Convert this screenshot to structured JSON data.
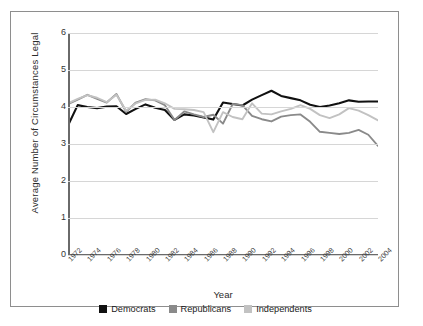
{
  "chart_data": {
    "type": "line",
    "title": "",
    "xlabel": "Year",
    "ylabel": "Average Number of Circumstances Legal",
    "xlim": [
      1972,
      2004
    ],
    "ylim": [
      0,
      6
    ],
    "yticks": [
      0,
      1,
      2,
      3,
      4,
      5,
      6
    ],
    "xticks": [
      1972,
      1974,
      1976,
      1978,
      1980,
      1982,
      1984,
      1986,
      1988,
      1990,
      1992,
      1994,
      1996,
      1998,
      2000,
      2002,
      2004
    ],
    "grid": true,
    "legend_position": "bottom",
    "x": [
      1972,
      1973,
      1974,
      1975,
      1976,
      1977,
      1978,
      1979,
      1980,
      1981,
      1982,
      1983,
      1984,
      1985,
      1986,
      1987,
      1988,
      1989,
      1990,
      1991,
      1992,
      1993,
      1994,
      1995,
      1996,
      1997,
      1998,
      1999,
      2000,
      2001,
      2002,
      2003,
      2004
    ],
    "series": [
      {
        "name": "Democrats",
        "color": "#111111",
        "values": [
          3.5,
          4.05,
          4.0,
          3.97,
          4.01,
          4.02,
          3.81,
          3.95,
          4.07,
          3.98,
          3.92,
          3.65,
          3.8,
          3.77,
          3.72,
          3.66,
          4.12,
          4.08,
          4.04,
          4.2,
          4.32,
          4.44,
          4.3,
          4.24,
          4.18,
          4.06,
          4.0,
          4.04,
          4.1,
          4.18,
          4.14,
          4.15,
          4.15
        ]
      },
      {
        "name": "Republicans",
        "color": "#8a8a8a",
        "values": [
          4.08,
          4.2,
          4.33,
          4.22,
          4.12,
          4.35,
          3.87,
          4.12,
          4.21,
          4.18,
          4.05,
          3.65,
          3.88,
          3.8,
          3.73,
          3.79,
          3.55,
          4.08,
          4.05,
          3.76,
          3.67,
          3.61,
          3.74,
          3.78,
          3.8,
          3.6,
          3.33,
          3.3,
          3.27,
          3.3,
          3.38,
          3.25,
          2.95
        ]
      },
      {
        "name": "Independents",
        "color": "#c2c2c2",
        "values": [
          4.1,
          4.22,
          4.32,
          4.25,
          4.13,
          4.33,
          3.9,
          4.1,
          4.19,
          4.2,
          4.1,
          3.95,
          3.94,
          3.92,
          3.86,
          3.32,
          3.86,
          3.73,
          3.67,
          4.1,
          3.82,
          3.8,
          3.88,
          3.95,
          4.05,
          3.95,
          3.78,
          3.7,
          3.8,
          3.97,
          3.9,
          3.78,
          3.64
        ]
      }
    ]
  },
  "legend": {
    "items": [
      {
        "label": "Democrats",
        "color": "#111111"
      },
      {
        "label": "Republicans",
        "color": "#8a8a8a"
      },
      {
        "label": "Independents",
        "color": "#c2c2c2"
      }
    ]
  },
  "caption": ""
}
